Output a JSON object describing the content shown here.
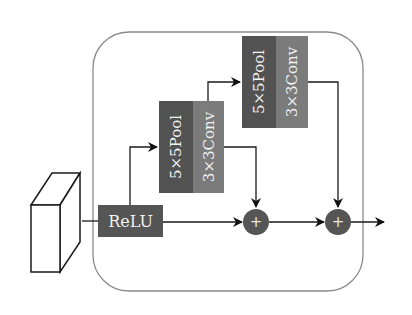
{
  "diagram": {
    "input": {
      "label": ""
    },
    "relu": {
      "label": "ReLU"
    },
    "block1": {
      "pool_label": "5×5Pool",
      "conv_label": "3×3Conv"
    },
    "block2": {
      "pool_label": "5×5Pool",
      "conv_label": "3×3Conv"
    },
    "sum1": {
      "symbol": "+"
    },
    "sum2": {
      "symbol": "+"
    }
  },
  "colors": {
    "relu": "#555555",
    "pool": "#525252",
    "conv": "#7b7b7b",
    "sum": "#555555",
    "line": "#1a1a1a",
    "frame": "#8a8a8a"
  }
}
